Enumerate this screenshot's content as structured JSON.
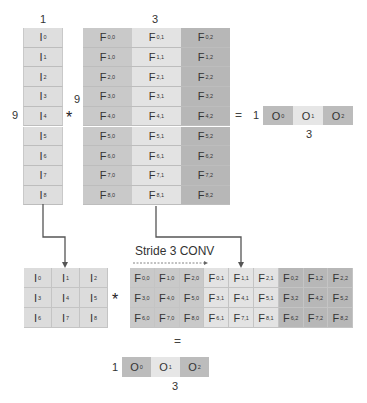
{
  "top": {
    "input_vector": {
      "width_label": "1",
      "height_label": "9",
      "cells": [
        {
          "base": "I",
          "sub": "0"
        },
        {
          "base": "I",
          "sub": "1"
        },
        {
          "base": "I",
          "sub": "2"
        },
        {
          "base": "I",
          "sub": "3"
        },
        {
          "base": "I",
          "sub": "4"
        },
        {
          "base": "I",
          "sub": "5"
        },
        {
          "base": "I",
          "sub": "6"
        },
        {
          "base": "I",
          "sub": "7"
        },
        {
          "base": "I",
          "sub": "8"
        }
      ]
    },
    "operator": "*",
    "filter_matrix": {
      "width_label": "3",
      "height_label": "9",
      "rows": [
        [
          {
            "base": "F",
            "sub": "0,0"
          },
          {
            "base": "F",
            "sub": "0,1"
          },
          {
            "base": "F",
            "sub": "0,2"
          }
        ],
        [
          {
            "base": "F",
            "sub": "1,0"
          },
          {
            "base": "F",
            "sub": "1,1"
          },
          {
            "base": "F",
            "sub": "1,2"
          }
        ],
        [
          {
            "base": "F",
            "sub": "2,0"
          },
          {
            "base": "F",
            "sub": "2,1"
          },
          {
            "base": "F",
            "sub": "2,2"
          }
        ],
        [
          {
            "base": "F",
            "sub": "3,0"
          },
          {
            "base": "F",
            "sub": "3,1"
          },
          {
            "base": "F",
            "sub": "3,2"
          }
        ],
        [
          {
            "base": "F",
            "sub": "4,0"
          },
          {
            "base": "F",
            "sub": "4,1"
          },
          {
            "base": "F",
            "sub": "4,2"
          }
        ],
        [
          {
            "base": "F",
            "sub": "5,0"
          },
          {
            "base": "F",
            "sub": "5,1"
          },
          {
            "base": "F",
            "sub": "5,2"
          }
        ],
        [
          {
            "base": "F",
            "sub": "6,0"
          },
          {
            "base": "F",
            "sub": "6,1"
          },
          {
            "base": "F",
            "sub": "6,2"
          }
        ],
        [
          {
            "base": "F",
            "sub": "7,0"
          },
          {
            "base": "F",
            "sub": "7,1"
          },
          {
            "base": "F",
            "sub": "7,2"
          }
        ],
        [
          {
            "base": "F",
            "sub": "8,0"
          },
          {
            "base": "F",
            "sub": "8,1"
          },
          {
            "base": "F",
            "sub": "8,2"
          }
        ]
      ]
    },
    "equals": "=",
    "output": {
      "height_label": "1",
      "width_label": "3",
      "cells": [
        {
          "base": "O",
          "sub": "0"
        },
        {
          "base": "O",
          "sub": "1"
        },
        {
          "base": "O",
          "sub": "2"
        }
      ]
    }
  },
  "bottom": {
    "stride_label": "Stride 3 CONV",
    "input_grid": {
      "rows": [
        [
          {
            "base": "I",
            "sub": "0"
          },
          {
            "base": "I",
            "sub": "1"
          },
          {
            "base": "I",
            "sub": "2"
          }
        ],
        [
          {
            "base": "I",
            "sub": "3"
          },
          {
            "base": "I",
            "sub": "4"
          },
          {
            "base": "I",
            "sub": "5"
          }
        ],
        [
          {
            "base": "I",
            "sub": "6"
          },
          {
            "base": "I",
            "sub": "7"
          },
          {
            "base": "I",
            "sub": "8"
          }
        ]
      ]
    },
    "operator": "*",
    "filter_grid": {
      "rows": [
        [
          {
            "base": "F",
            "sub": "0,0"
          },
          {
            "base": "F",
            "sub": "1,0"
          },
          {
            "base": "F",
            "sub": "2,0"
          },
          {
            "base": "F",
            "sub": "0,1"
          },
          {
            "base": "F",
            "sub": "1,1"
          },
          {
            "base": "F",
            "sub": "2,1"
          },
          {
            "base": "F",
            "sub": "0,2"
          },
          {
            "base": "F",
            "sub": "1,2"
          },
          {
            "base": "F",
            "sub": "2,2"
          }
        ],
        [
          {
            "base": "F",
            "sub": "3,0"
          },
          {
            "base": "F",
            "sub": "4,0"
          },
          {
            "base": "F",
            "sub": "5,0"
          },
          {
            "base": "F",
            "sub": "3,1"
          },
          {
            "base": "F",
            "sub": "4,1"
          },
          {
            "base": "F",
            "sub": "5,1"
          },
          {
            "base": "F",
            "sub": "3,2"
          },
          {
            "base": "F",
            "sub": "4,2"
          },
          {
            "base": "F",
            "sub": "5,2"
          }
        ],
        [
          {
            "base": "F",
            "sub": "6,0"
          },
          {
            "base": "F",
            "sub": "7,0"
          },
          {
            "base": "F",
            "sub": "8,0"
          },
          {
            "base": "F",
            "sub": "6,1"
          },
          {
            "base": "F",
            "sub": "7,1"
          },
          {
            "base": "F",
            "sub": "8,1"
          },
          {
            "base": "F",
            "sub": "6,2"
          },
          {
            "base": "F",
            "sub": "7,2"
          },
          {
            "base": "F",
            "sub": "8,2"
          }
        ]
      ]
    },
    "equals": "=",
    "output": {
      "height_label": "1",
      "width_label": "3",
      "cells": [
        {
          "base": "O",
          "sub": "0"
        },
        {
          "base": "O",
          "sub": "1"
        },
        {
          "base": "O",
          "sub": "2"
        }
      ]
    }
  },
  "colors": {
    "filter_col0": "#c9c9c9",
    "filter_col1": "#e3e3e3",
    "filter_col2": "#b7b7b7",
    "input_cell": "#dedede",
    "arrow": "#555555"
  }
}
